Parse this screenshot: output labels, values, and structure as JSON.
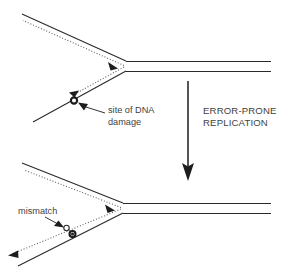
{
  "figure": {
    "background_color": "#ffffff",
    "line_color": "#2a2a2a",
    "text_color": "#3f3f3f",
    "width": 282,
    "height": 273
  },
  "labels": {
    "damage_line1": "site of DNA",
    "damage_line2": "damage",
    "process_line1": "ERROR-PRONE",
    "process_line2": "REPLICATION",
    "mismatch": "mismatch"
  },
  "panels": [
    {
      "id": "top-fork",
      "name": "replication fork with DNA damage",
      "marker": "site-of-dna-damage",
      "marker_type": "open-circle",
      "marker_position": [
        74,
        100
      ]
    },
    {
      "id": "bottom-fork",
      "name": "replication fork with mismatch",
      "marker": "mismatch",
      "marker_type": "open-circle-and-filled-circle",
      "marker_position": [
        70,
        233
      ]
    }
  ],
  "process_arrow": {
    "direction": "down",
    "x": 188,
    "y_start": 81,
    "y_end": 180
  }
}
